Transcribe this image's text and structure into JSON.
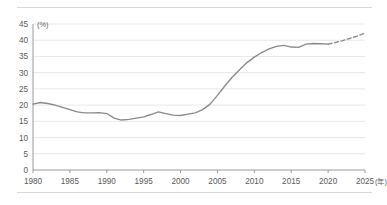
{
  "chart_data": {
    "type": "line",
    "title": "",
    "subtitle": "",
    "xlabel": "",
    "ylabel": "",
    "y_unit_label": "(%)",
    "x_unit_label": "(年)",
    "grid": true,
    "legend_position": "none",
    "xlim": [
      1980,
      2025
    ],
    "ylim": [
      0,
      45
    ],
    "y_ticks": [
      0,
      5,
      10,
      15,
      20,
      25,
      30,
      35,
      40,
      45
    ],
    "y_tick_labels": [
      "0",
      "5",
      "10",
      "15",
      "20",
      "25",
      "30",
      "35",
      "40",
      "45"
    ],
    "x_ticks": [
      1980,
      1985,
      1990,
      1995,
      2000,
      2005,
      2010,
      2015,
      2020,
      2025
    ],
    "x_tick_labels": [
      "1980",
      "1985",
      "1990",
      "1995",
      "2000",
      "2005",
      "2010",
      "2015",
      "2020",
      "2025"
    ],
    "series": [
      {
        "name": "actual",
        "style": "solid",
        "color": "#8a8a8a",
        "x": [
          1980,
          1981,
          1982,
          1983,
          1984,
          1985,
          1986,
          1987,
          1988,
          1989,
          1990,
          1991,
          1992,
          1993,
          1994,
          1995,
          1996,
          1997,
          1998,
          1999,
          2000,
          2001,
          2002,
          2003,
          2004,
          2005,
          2006,
          2007,
          2008,
          2009,
          2010,
          2011,
          2012,
          2013,
          2014,
          2015,
          2016,
          2017,
          2018,
          2019,
          2020
        ],
        "values": [
          20.3,
          20.8,
          20.5,
          20.0,
          19.3,
          18.6,
          17.9,
          17.6,
          17.6,
          17.7,
          17.4,
          16.0,
          15.4,
          15.6,
          16.0,
          16.4,
          17.1,
          17.9,
          17.4,
          16.9,
          16.8,
          17.2,
          17.6,
          18.6,
          20.3,
          23.0,
          25.9,
          28.6,
          30.9,
          33.1,
          34.8,
          36.2,
          37.3,
          38.1,
          38.4,
          37.9,
          37.8,
          38.8,
          39.0,
          38.9,
          38.8
        ]
      },
      {
        "name": "forecast",
        "style": "dashed",
        "color": "#8a8a8a",
        "x": [
          2020,
          2021,
          2022,
          2023,
          2024,
          2025
        ],
        "values": [
          38.8,
          39.3,
          39.9,
          40.6,
          41.3,
          42.2
        ]
      }
    ]
  }
}
